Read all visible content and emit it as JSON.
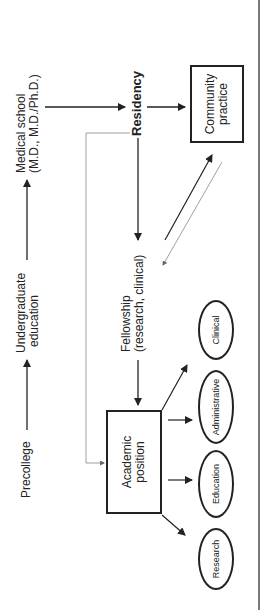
{
  "diagram": {
    "stages": {
      "precollege": "Precollege",
      "undergraduate": [
        "Undergraduate",
        "education"
      ],
      "medical_school": [
        "Medical school",
        "(M.D., M.D./Ph.D.)"
      ],
      "residency": "Residency",
      "fellowship": [
        "Fellowship",
        "(research, clinical)"
      ]
    },
    "boxes": {
      "community_practice": [
        "Community",
        "practice"
      ],
      "academic_position": [
        "Academic",
        "position"
      ]
    },
    "ovals": {
      "research": "Research",
      "education": "Education",
      "administrative": "Administrative",
      "clinical": "Clinical"
    },
    "colors": {
      "line": "#222222",
      "thin_line": "#888888",
      "background": "#ffffff"
    }
  }
}
